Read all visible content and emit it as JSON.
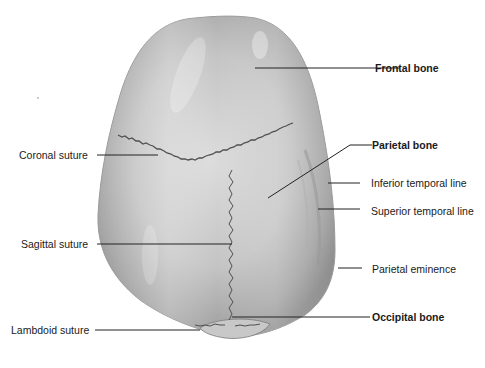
{
  "diagram": {
    "labels_left": [
      {
        "text": "Coronal suture",
        "bold": false
      },
      {
        "text": "Sagittal suture",
        "bold": false
      },
      {
        "text": "Lambdoid suture",
        "bold": false
      }
    ],
    "labels_right": [
      {
        "text": "Frontal bone",
        "bold": true
      },
      {
        "text": "Parietal bone",
        "bold": true
      },
      {
        "text": "Inferior temporal line",
        "bold": false
      },
      {
        "text": "Superior temporal line",
        "bold": false
      },
      {
        "text": "Parietal eminence",
        "bold": false
      },
      {
        "text": "Occipital bone",
        "bold": true
      }
    ],
    "colors": {
      "bone_light": "#d9d9d9",
      "bone_mid": "#b8b8b8",
      "bone_dark": "#8a8a8a",
      "suture": "#555555",
      "leader_line": "#222222",
      "text": "#1a1a1a"
    }
  }
}
